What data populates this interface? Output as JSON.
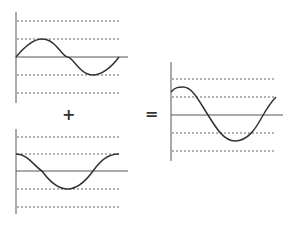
{
  "diagram": {
    "title": "",
    "operators": {
      "plus": "+",
      "equals": "="
    },
    "colors": {
      "curve": "#333333",
      "axis": "#555555",
      "grid": "#666666",
      "background": "#ffffff"
    },
    "panels": [
      {
        "id": "wave-a",
        "label": "",
        "shape": "sine",
        "phase": "starts at zero, rises"
      },
      {
        "id": "wave-b",
        "label": "",
        "shape": "cosine",
        "phase": "starts at max, falls"
      },
      {
        "id": "wave-sum",
        "label": "",
        "shape": "sum",
        "phase": "starts above zero, larger amplitude"
      }
    ]
  }
}
